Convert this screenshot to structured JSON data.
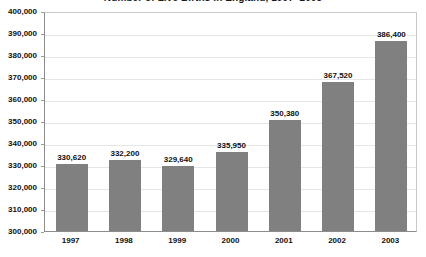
{
  "chart_data": {
    "type": "bar",
    "title": "Number of Live Births in England, 1997–2003",
    "xlabel": "",
    "ylabel": "",
    "categories": [
      "1997",
      "1998",
      "1999",
      "2000",
      "2001",
      "2002",
      "2003"
    ],
    "values": [
      330620,
      332200,
      329640,
      335950,
      350380,
      367520,
      386400
    ],
    "value_labels": [
      "330,620",
      "332,200",
      "329,640",
      "335,950",
      "350,380",
      "367,520",
      "386,400"
    ],
    "ylim": [
      300000,
      400000
    ],
    "ytick_labels": [
      "400,000",
      "390,000",
      "380,000",
      "370,000",
      "360,000",
      "350,000",
      "340,000",
      "330,000",
      "320,000",
      "310,000",
      "300,000"
    ],
    "ytick_values": [
      400000,
      390000,
      380000,
      370000,
      360000,
      350000,
      340000,
      330000,
      320000,
      310000,
      300000
    ],
    "grid": true,
    "legend": false,
    "legend_position": "none",
    "series": [
      {
        "name": "Live births",
        "values": [
          330620,
          332200,
          329640,
          335950,
          350380,
          367520,
          386400
        ]
      }
    ],
    "colors": {
      "bar_fill": "#808080",
      "gridline": "#e6e6e6",
      "axis_line": "#8c8c8c",
      "plot_background": "#ffffff",
      "text": "#111111"
    }
  }
}
